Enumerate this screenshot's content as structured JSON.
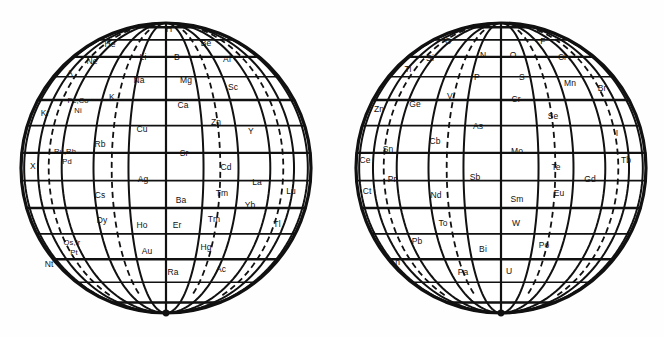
{
  "figure": {
    "type": "diagram",
    "subtype": "spiral-periodic-system-globes",
    "background_color": "#ffffff",
    "line_color": "#111111",
    "globe_count": 2
  },
  "globes": [
    {
      "id": "globe-left",
      "name": "left-globe",
      "center_x": 166,
      "center_y": 168,
      "radius": 145,
      "cells": [
        {
          "s": "H",
          "x": 169,
          "y": 30,
          "cls": "lbl"
        },
        {
          "s": "He",
          "x": 110,
          "y": 45,
          "cls": "lbl"
        },
        {
          "s": "Be",
          "x": 206,
          "y": 44,
          "cls": "lbl"
        },
        {
          "s": "Li",
          "x": 143,
          "y": 58,
          "cls": "lbl"
        },
        {
          "s": "B",
          "x": 177,
          "y": 58,
          "cls": "lbl"
        },
        {
          "s": "Ne",
          "x": 92,
          "y": 62,
          "cls": "lbl"
        },
        {
          "s": "Al",
          "x": 227,
          "y": 60,
          "cls": "lbl"
        },
        {
          "s": "A",
          "x": 70,
          "y": 74,
          "cls": "lbl"
        },
        {
          "s": "Na",
          "x": 139,
          "y": 81,
          "cls": "lbl"
        },
        {
          "s": "Mg",
          "x": 186,
          "y": 81,
          "cls": "lbl"
        },
        {
          "s": "Sc",
          "x": 233,
          "y": 88,
          "cls": "lbl"
        },
        {
          "s": "K",
          "x": 112,
          "y": 98,
          "cls": "lbl"
        },
        {
          "s": "Fe,Co",
          "x": 78,
          "y": 101,
          "cls": "lbl two"
        },
        {
          "s": "Ni",
          "x": 78,
          "y": 111,
          "cls": "lbl two"
        },
        {
          "s": "Ca",
          "x": 183,
          "y": 106,
          "cls": "lbl"
        },
        {
          "s": "Kr",
          "x": 45,
          "y": 114,
          "cls": "lbl"
        },
        {
          "s": "Zn",
          "x": 216,
          "y": 123,
          "cls": "lbl"
        },
        {
          "s": "Cu",
          "x": 142,
          "y": 130,
          "cls": "lbl"
        },
        {
          "s": "Y",
          "x": 251,
          "y": 132,
          "cls": "lbl"
        },
        {
          "s": "Rb",
          "x": 100,
          "y": 145,
          "cls": "lbl"
        },
        {
          "s": "Ru,Rh",
          "x": 65,
          "y": 152,
          "cls": "lbl two"
        },
        {
          "s": "Pd",
          "x": 67,
          "y": 162,
          "cls": "lbl two"
        },
        {
          "s": "Sr",
          "x": 184,
          "y": 154,
          "cls": "lbl"
        },
        {
          "s": "X",
          "x": 33,
          "y": 167,
          "cls": "lbl"
        },
        {
          "s": "Cd",
          "x": 226,
          "y": 168,
          "cls": "lbl"
        },
        {
          "s": "Ag",
          "x": 143,
          "y": 180,
          "cls": "lbl"
        },
        {
          "s": "La",
          "x": 257,
          "y": 183,
          "cls": "lbl"
        },
        {
          "s": "Lu",
          "x": 291,
          "y": 192,
          "cls": "lbl"
        },
        {
          "s": "Cs",
          "x": 100,
          "y": 196,
          "cls": "lbl"
        },
        {
          "s": "Tm",
          "x": 222,
          "y": 194,
          "cls": "lbl"
        },
        {
          "s": "Ba",
          "x": 181,
          "y": 201,
          "cls": "lbl"
        },
        {
          "s": "Yb",
          "x": 250,
          "y": 206,
          "cls": "lbl"
        },
        {
          "s": "Dy",
          "x": 102,
          "y": 221,
          "cls": "lbl"
        },
        {
          "s": "Tm",
          "x": 214,
          "y": 220,
          "cls": "lbl"
        },
        {
          "s": "Ho",
          "x": 142,
          "y": 226,
          "cls": "lbl"
        },
        {
          "s": "Er",
          "x": 177,
          "y": 226,
          "cls": "lbl"
        },
        {
          "s": "Tl",
          "x": 277,
          "y": 225,
          "cls": "lbl"
        },
        {
          "s": "Os,Ir",
          "x": 72,
          "y": 243,
          "cls": "lbl two"
        },
        {
          "s": "Pt",
          "x": 74,
          "y": 253,
          "cls": "lbl two"
        },
        {
          "s": "Au",
          "x": 147,
          "y": 252,
          "cls": "lbl"
        },
        {
          "s": "Hg",
          "x": 206,
          "y": 248,
          "cls": "lbl"
        },
        {
          "s": "Nt",
          "x": 49,
          "y": 265,
          "cls": "lbl"
        },
        {
          "s": "Ra",
          "x": 173,
          "y": 273,
          "cls": "lbl"
        },
        {
          "s": "Ac",
          "x": 221,
          "y": 270,
          "cls": "lbl"
        }
      ]
    },
    {
      "id": "globe-right",
      "name": "right-globe",
      "center_x": 501,
      "center_y": 168,
      "radius": 145,
      "cells": [
        {
          "s": "C",
          "x": 448,
          "y": 42,
          "cls": "lbl"
        },
        {
          "s": "F",
          "x": 543,
          "y": 42,
          "cls": "lbl"
        },
        {
          "s": "N",
          "x": 483,
          "y": 56,
          "cls": "lbl"
        },
        {
          "s": "O",
          "x": 513,
          "y": 56,
          "cls": "lbl"
        },
        {
          "s": "Si",
          "x": 430,
          "y": 59,
          "cls": "lbl"
        },
        {
          "s": "Cl",
          "x": 562,
          "y": 58,
          "cls": "lbl"
        },
        {
          "s": "Ti",
          "x": 408,
          "y": 70,
          "cls": "lbl"
        },
        {
          "s": "P",
          "x": 477,
          "y": 78,
          "cls": "lbl"
        },
        {
          "s": "S",
          "x": 522,
          "y": 78,
          "cls": "lbl"
        },
        {
          "s": "Mn",
          "x": 570,
          "y": 84,
          "cls": "lbl"
        },
        {
          "s": "V",
          "x": 450,
          "y": 97,
          "cls": "lbl"
        },
        {
          "s": "Br",
          "x": 602,
          "y": 89,
          "cls": "lbl"
        },
        {
          "s": "Cr",
          "x": 516,
          "y": 100,
          "cls": "lbl"
        },
        {
          "s": "Ge",
          "x": 415,
          "y": 105,
          "cls": "lbl"
        },
        {
          "s": "Zn",
          "x": 379,
          "y": 110,
          "cls": "lbl"
        },
        {
          "s": "Se",
          "x": 553,
          "y": 117,
          "cls": "lbl"
        },
        {
          "s": "As",
          "x": 478,
          "y": 127,
          "cls": "lbl"
        },
        {
          "s": "I",
          "x": 617,
          "y": 134,
          "cls": "lbl"
        },
        {
          "s": "Cb",
          "x": 435,
          "y": 142,
          "cls": "lbl"
        },
        {
          "s": "Sn",
          "x": 388,
          "y": 150,
          "cls": "lbl"
        },
        {
          "s": "Mo",
          "x": 517,
          "y": 152,
          "cls": "lbl"
        },
        {
          "s": "Ce",
          "x": 365,
          "y": 161,
          "cls": "lbl"
        },
        {
          "s": "Te",
          "x": 556,
          "y": 168,
          "cls": "lbl"
        },
        {
          "s": "Tb",
          "x": 626,
          "y": 161,
          "cls": "lbl"
        },
        {
          "s": "Sb",
          "x": 475,
          "y": 178,
          "cls": "lbl"
        },
        {
          "s": "Pr",
          "x": 392,
          "y": 180,
          "cls": "lbl"
        },
        {
          "s": "Gd",
          "x": 590,
          "y": 180,
          "cls": "lbl"
        },
        {
          "s": "Ct",
          "x": 367,
          "y": 192,
          "cls": "lbl"
        },
        {
          "s": "Nd",
          "x": 436,
          "y": 196,
          "cls": "lbl"
        },
        {
          "s": "Eu",
          "x": 559,
          "y": 194,
          "cls": "lbl"
        },
        {
          "s": "Sm",
          "x": 517,
          "y": 200,
          "cls": "lbl"
        },
        {
          "s": "To",
          "x": 443,
          "y": 224,
          "cls": "lbl"
        },
        {
          "s": "W",
          "x": 516,
          "y": 224,
          "cls": "lbl"
        },
        {
          "s": "Pb",
          "x": 417,
          "y": 242,
          "cls": "lbl"
        },
        {
          "s": "Bi",
          "x": 483,
          "y": 250,
          "cls": "lbl"
        },
        {
          "s": "Po",
          "x": 544,
          "y": 246,
          "cls": "lbl"
        },
        {
          "s": "Th",
          "x": 395,
          "y": 263,
          "cls": "lbl"
        },
        {
          "s": "Pa",
          "x": 463,
          "y": 273,
          "cls": "lbl"
        },
        {
          "s": "U",
          "x": 509,
          "y": 272,
          "cls": "lbl"
        }
      ]
    }
  ],
  "geometry": {
    "latitudes_deg": [
      76,
      62,
      50,
      39,
      28,
      17,
      6,
      -5,
      -16,
      -27,
      -39,
      -52,
      -68
    ],
    "meridians_deg": [
      -78,
      -62,
      -46,
      -30,
      -15,
      0,
      15,
      30,
      46,
      62,
      78
    ],
    "dashed_meridians_deg": [
      -54,
      -22,
      22,
      54
    ],
    "outline_stroke_width": 3.2,
    "grid_stroke_width": 1.9,
    "dash_pattern": "6 4"
  }
}
